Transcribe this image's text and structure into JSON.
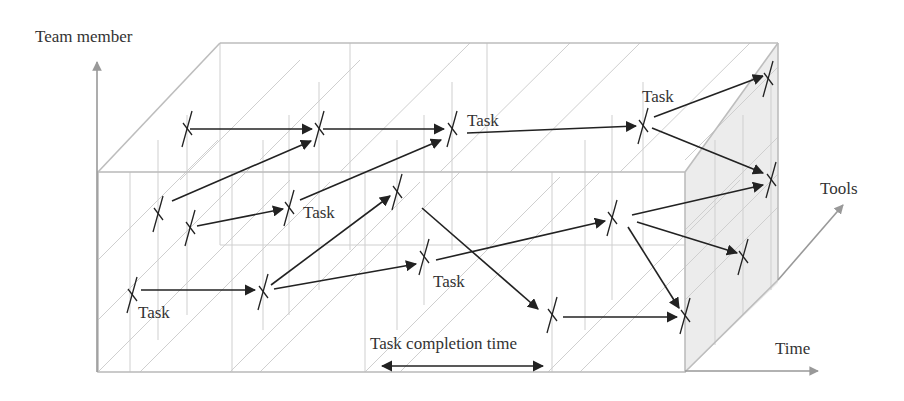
{
  "axes": {
    "y_label": "Team member",
    "z_label": "Tools",
    "x_label": "Time"
  },
  "annotations": {
    "task": "Task",
    "completion": "Task completion time"
  },
  "colors": {
    "axis": "#999999",
    "grid": "#c8c8c8",
    "box": "#bdbdbd",
    "shade": "#ececec",
    "arrow": "#222222",
    "text": "#333333"
  },
  "task_labels": [
    {
      "text": "Task",
      "x": 138,
      "y": 318
    },
    {
      "text": "Task",
      "x": 303,
      "y": 218
    },
    {
      "text": "Task",
      "x": 467,
      "y": 126
    },
    {
      "text": "Task",
      "x": 433,
      "y": 287
    },
    {
      "text": "Task",
      "x": 642,
      "y": 102
    }
  ],
  "tasks": [
    {
      "x": 187,
      "y": 129
    },
    {
      "x": 319,
      "y": 129
    },
    {
      "x": 452,
      "y": 129
    },
    {
      "x": 158,
      "y": 214
    },
    {
      "x": 190,
      "y": 228
    },
    {
      "x": 289,
      "y": 208
    },
    {
      "x": 397,
      "y": 192
    },
    {
      "x": 132,
      "y": 295
    },
    {
      "x": 263,
      "y": 292
    },
    {
      "x": 424,
      "y": 257
    },
    {
      "x": 612,
      "y": 218
    },
    {
      "x": 552,
      "y": 315
    },
    {
      "x": 643,
      "y": 126
    },
    {
      "x": 768,
      "y": 79
    },
    {
      "x": 771,
      "y": 180
    },
    {
      "x": 743,
      "y": 257
    },
    {
      "x": 685,
      "y": 316
    }
  ]
}
